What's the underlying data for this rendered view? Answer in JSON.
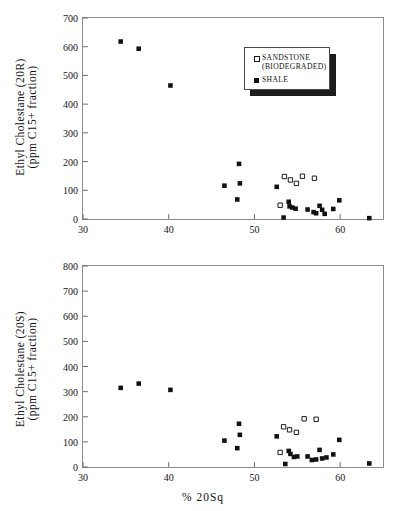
{
  "figure": {
    "xlabel": "% 20Sq",
    "legend": {
      "sandstone_line1": "SANDSTONE",
      "sandstone_line2": "(BIODEGRADED)",
      "shale": "SHALE"
    }
  },
  "chart_data": [
    {
      "type": "scatter",
      "title": "",
      "panel": "top",
      "xlabel": "% 20Sq",
      "ylabel": "Ethyl Cholestane (20R) (ppm C15+ fraction)",
      "ylabel_line1": "Ethyl Cholestane (20R)",
      "ylabel_line2": "(ppm C15+ fraction)",
      "xlim": [
        30,
        65
      ],
      "ylim": [
        0,
        700
      ],
      "xticks": [
        30,
        40,
        50,
        60
      ],
      "yticks": [
        0,
        100,
        200,
        300,
        400,
        500,
        600,
        700
      ],
      "xtick_labels": [
        "30",
        "40",
        "50",
        "60"
      ],
      "ytick_labels": [
        "0",
        "100",
        "200",
        "300",
        "400",
        "500",
        "600",
        "700"
      ],
      "grid": false,
      "legend_position": "upper right",
      "series": [
        {
          "name": "SHALE",
          "marker": "filled-square",
          "color": "#111111",
          "points": [
            [
              34.4,
              618
            ],
            [
              36.5,
              593
            ],
            [
              40.2,
              465
            ],
            [
              46.5,
              116
            ],
            [
              48.2,
              192
            ],
            [
              48.3,
              124
            ],
            [
              48.0,
              68
            ],
            [
              52.6,
              112
            ],
            [
              53.4,
              5
            ],
            [
              54.0,
              60
            ],
            [
              54.1,
              44
            ],
            [
              54.4,
              40
            ],
            [
              54.8,
              36
            ],
            [
              56.2,
              33
            ],
            [
              56.9,
              24
            ],
            [
              57.2,
              20
            ],
            [
              57.6,
              46
            ],
            [
              57.9,
              32
            ],
            [
              58.2,
              18
            ],
            [
              59.2,
              35
            ],
            [
              59.9,
              65
            ],
            [
              63.4,
              3
            ]
          ]
        },
        {
          "name": "SANDSTONE (BIODEGRADED)",
          "marker": "open-square",
          "color": "#1a1a1a",
          "points": [
            [
              53.5,
              148
            ],
            [
              54.2,
              136
            ],
            [
              54.9,
              124
            ],
            [
              55.6,
              149
            ],
            [
              57.0,
              142
            ],
            [
              53.0,
              48
            ]
          ]
        }
      ]
    },
    {
      "type": "scatter",
      "title": "",
      "panel": "bottom",
      "xlabel": "% 20Sq",
      "ylabel": "Ethyl Cholestane (20S) (ppm C15+ fraction)",
      "ylabel_line1": "Ethyl Cholestane (20S)",
      "ylabel_line2": "(ppm C15+ fraction)",
      "xlim": [
        30,
        65
      ],
      "ylim": [
        0,
        800
      ],
      "xticks": [
        30,
        40,
        50,
        60
      ],
      "yticks": [
        0,
        100,
        200,
        300,
        400,
        500,
        600,
        700,
        800
      ],
      "xtick_labels": [
        "30",
        "40",
        "50",
        "60"
      ],
      "ytick_labels": [
        "0",
        "100",
        "200",
        "300",
        "400",
        "500",
        "600",
        "700",
        "800"
      ],
      "grid": false,
      "legend_position": "none",
      "series": [
        {
          "name": "SHALE",
          "marker": "filled-square",
          "color": "#111111",
          "points": [
            [
              34.4,
              315
            ],
            [
              36.5,
              332
            ],
            [
              40.2,
              307
            ],
            [
              46.5,
              105
            ],
            [
              48.2,
              172
            ],
            [
              48.3,
              128
            ],
            [
              48.0,
              75
            ],
            [
              52.6,
              122
            ],
            [
              53.6,
              12
            ],
            [
              54.0,
              64
            ],
            [
              54.2,
              52
            ],
            [
              54.6,
              40
            ],
            [
              55.0,
              42
            ],
            [
              56.2,
              42
            ],
            [
              56.7,
              28
            ],
            [
              57.2,
              30
            ],
            [
              57.6,
              68
            ],
            [
              57.9,
              34
            ],
            [
              58.4,
              38
            ],
            [
              59.2,
              50
            ],
            [
              59.9,
              108
            ],
            [
              63.4,
              14
            ]
          ]
        },
        {
          "name": "SANDSTONE (BIODEGRADED)",
          "marker": "open-square",
          "color": "#1a1a1a",
          "points": [
            [
              53.4,
              160
            ],
            [
              54.1,
              148
            ],
            [
              54.9,
              138
            ],
            [
              55.8,
              192
            ],
            [
              57.2,
              190
            ],
            [
              53.0,
              58
            ]
          ]
        }
      ]
    }
  ]
}
